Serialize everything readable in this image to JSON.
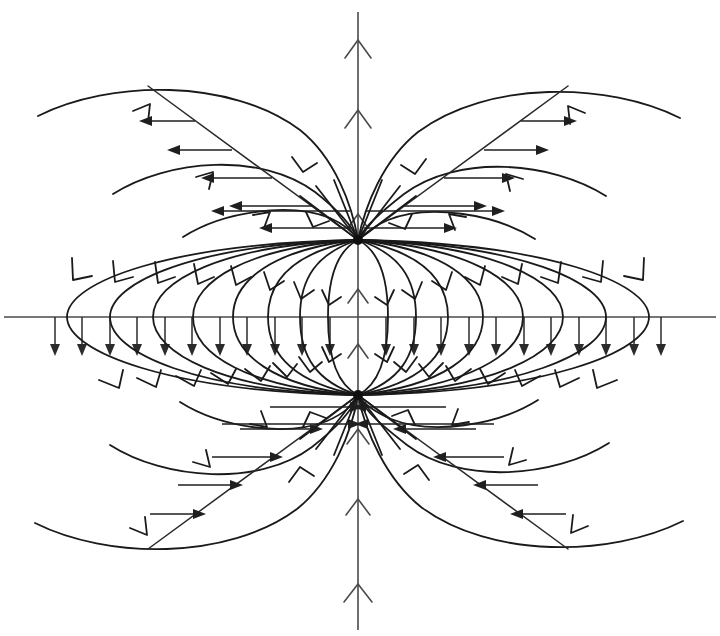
{
  "diagram": {
    "kind": "vector-field-streamlines",
    "background_color": "#ffffff",
    "line_color": "#1a1a1a",
    "axis_color": "#4a4a4a",
    "canvas": {
      "width": 720,
      "height": 636
    },
    "axes": {
      "vertical": {
        "name": "vertical-axis",
        "x": 358,
        "y_top": 12,
        "y_bottom": 630,
        "direction": "up",
        "arrowheads_at_y": [
          42,
          110,
          215,
          290,
          345,
          430,
          500,
          585
        ]
      },
      "horizontal": {
        "name": "horizontal-axis",
        "y": 317,
        "x_left": 4,
        "x_right": 716,
        "direction": "none"
      }
    },
    "nodes": [
      {
        "name": "upper-node",
        "label": "source",
        "x": 358,
        "y": 240,
        "radius": 5
      },
      {
        "name": "lower-node",
        "label": "sink",
        "x": 358,
        "y": 395,
        "radius": 5
      }
    ],
    "axis_tick_arrows": {
      "name": "downward-tick-arrows",
      "direction": "down",
      "baseline_y": 317,
      "length": 36,
      "x_start": 55,
      "x_end": 661,
      "spacing": 27.5,
      "count": 23
    },
    "dipole_loops": {
      "description": "Closed field lines joining upper node to lower node",
      "half_widths": [
        30,
        58,
        90,
        125,
        165,
        205,
        248,
        291
      ],
      "arrow_direction": "downward-on-both-sides"
    },
    "outer_arcs": {
      "description": "Open arcs leaving the upper node outward and returning to the lower node",
      "count_per_side": 4
    },
    "diagonal_rays": {
      "description": "Straight separatrix rays through each node with transverse arrows",
      "slope_deg": 38,
      "transverse_arrow_counts": [
        4,
        4,
        4,
        4
      ]
    }
  }
}
